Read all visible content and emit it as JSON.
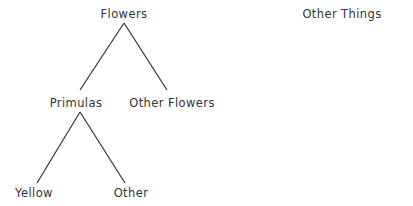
{
  "diagram": {
    "colors": {
      "ink": "#333333",
      "background": "#ffffff"
    },
    "nodes": {
      "flowers": {
        "label": "Flowers",
        "x": 124,
        "y": 18
      },
      "other_things": {
        "label": "Other Things",
        "x": 342,
        "y": 18
      },
      "primulas": {
        "label": "Primulas",
        "x": 76,
        "y": 107
      },
      "other_flowers": {
        "label": "Other Flowers",
        "x": 172,
        "y": 107
      },
      "yellow": {
        "label": "Yellow",
        "x": 34,
        "y": 197
      },
      "other": {
        "label": "Other",
        "x": 131,
        "y": 197
      }
    },
    "edges": [
      {
        "from": "flowers",
        "to": "primulas"
      },
      {
        "from": "flowers",
        "to": "other_flowers"
      },
      {
        "from": "primulas",
        "to": "yellow"
      },
      {
        "from": "primulas",
        "to": "other"
      }
    ]
  }
}
